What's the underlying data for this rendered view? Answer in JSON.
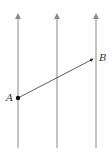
{
  "diagram": {
    "field_lines": [
      {
        "x": 18,
        "y_top": 14,
        "y_bottom": 148
      },
      {
        "x": 57,
        "y_top": 14,
        "y_bottom": 148
      },
      {
        "x": 96,
        "y_top": 14,
        "y_bottom": 148
      }
    ],
    "line_color": "#8a8a8a",
    "points": {
      "A": {
        "label": "A",
        "x": 18,
        "y": 98
      },
      "B": {
        "label": "B",
        "x": 94,
        "y": 58
      }
    },
    "vector": {
      "from": "A",
      "to": "B",
      "color": "#333333"
    }
  }
}
